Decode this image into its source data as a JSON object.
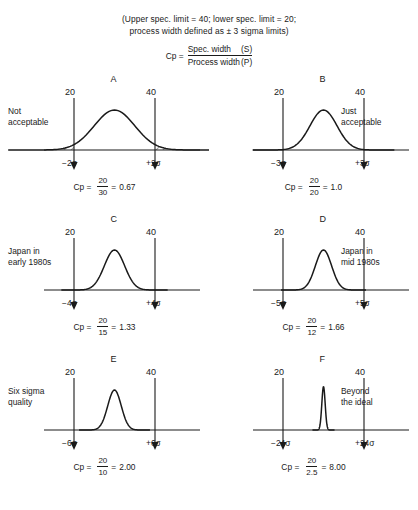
{
  "header": {
    "line1": "(Upper spec. limit = 40; lower spec. limit = 20;",
    "line2": "process width defined as ± 3 sigma limits)",
    "formula": {
      "lhs": "Cp =",
      "numerator": "Spec. width",
      "numerator_symbol": "(S)",
      "denominator": "Process width",
      "denominator_symbol": "(P)"
    }
  },
  "chart_data": {
    "type": "line",
    "xlabel": "",
    "ylabel": "",
    "spec_limits": {
      "lower": 20,
      "upper": 40
    },
    "process_width_definition": "± 3 sigma limits",
    "panels": [
      {
        "letter": "A",
        "caption_line1": "Not",
        "caption_line2": "acceptable",
        "lower_spec_label": "20",
        "upper_spec_label": "40",
        "sigma_left": "−2σ",
        "sigma_right": "+2σ",
        "cp_label": "Cp =",
        "cp_numerator": "20",
        "cp_denominator": "30",
        "cp_equals": "=",
        "cp_value": "0.67",
        "spec_width": 20,
        "process_width": 30,
        "cp": 0.67,
        "tails_shaded": true
      },
      {
        "letter": "B",
        "caption_line1": "Just",
        "caption_line2": "acceptable",
        "lower_spec_label": "20",
        "upper_spec_label": "40",
        "sigma_left": "−3σ",
        "sigma_right": "+3σ",
        "cp_label": "Cp =",
        "cp_numerator": "20",
        "cp_denominator": "20",
        "cp_equals": "=",
        "cp_value": "1.0",
        "spec_width": 20,
        "process_width": 20,
        "cp": 1.0,
        "tails_shaded": false
      },
      {
        "letter": "C",
        "caption_line1": "Japan in",
        "caption_line2": "early 1980s",
        "lower_spec_label": "20",
        "upper_spec_label": "40",
        "sigma_left": "−4σ",
        "sigma_right": "+4σ",
        "cp_label": "Cp =",
        "cp_numerator": "20",
        "cp_denominator": "15",
        "cp_equals": "=",
        "cp_value": "1.33",
        "spec_width": 20,
        "process_width": 15,
        "cp": 1.33,
        "tails_shaded": false
      },
      {
        "letter": "D",
        "caption_line1": "Japan in",
        "caption_line2": "mid 1980s",
        "lower_spec_label": "20",
        "upper_spec_label": "40",
        "sigma_left": "−5σ",
        "sigma_right": "+5σ",
        "cp_label": "Cp =",
        "cp_numerator": "20",
        "cp_denominator": "12",
        "cp_equals": "=",
        "cp_value": "1.66",
        "spec_width": 20,
        "process_width": 12,
        "cp": 1.66,
        "tails_shaded": false
      },
      {
        "letter": "E",
        "caption_line1": "Six sigma",
        "caption_line2": "quality",
        "lower_spec_label": "20",
        "upper_spec_label": "40",
        "sigma_left": "−6σ",
        "sigma_right": "+6σ",
        "cp_label": "Cp =",
        "cp_numerator": "20",
        "cp_denominator": "10",
        "cp_equals": "=",
        "cp_value": "2.00",
        "spec_width": 20,
        "process_width": 10,
        "cp": 2.0,
        "tails_shaded": false
      },
      {
        "letter": "F",
        "caption_line1": "Beyond",
        "caption_line2": "the ideal",
        "lower_spec_label": "20",
        "upper_spec_label": "40",
        "sigma_left": "−24σ",
        "sigma_right": "+24σ",
        "cp_label": "Cp =",
        "cp_numerator": "20",
        "cp_denominator": "2.5",
        "cp_equals": "=",
        "cp_value": "8.00",
        "spec_width": 20,
        "process_width": 2.5,
        "cp": 8.0,
        "tails_shaded": false
      }
    ]
  },
  "colors": {
    "ink": "#1a1a1a",
    "background": "#ffffff"
  }
}
